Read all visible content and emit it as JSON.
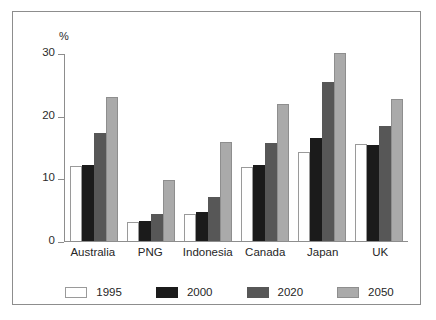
{
  "chart_data": {
    "type": "bar",
    "title": "",
    "subtitle": "",
    "xlabel": "",
    "ylabel": "%",
    "unit_label": "%",
    "ylim": [
      0,
      30
    ],
    "yticks": [
      0,
      10,
      20,
      30
    ],
    "ytick_labels": [
      "0",
      "10",
      "20",
      "30"
    ],
    "grid": false,
    "legend_position": "bottom",
    "categories": [
      "Australia",
      "PNG",
      "Indonesia",
      "Canada",
      "Japan",
      "UK"
    ],
    "series": [
      {
        "name": "1995",
        "color": "#ffffff",
        "values": [
          12.0,
          3.0,
          4.3,
          11.8,
          14.2,
          15.5
        ]
      },
      {
        "name": "2000",
        "color": "#1b1b1b",
        "values": [
          12.2,
          3.2,
          4.7,
          12.2,
          16.5,
          15.3
        ]
      },
      {
        "name": "2020",
        "color": "#575757",
        "values": [
          17.3,
          4.3,
          7.1,
          15.7,
          25.3,
          18.4
        ]
      },
      {
        "name": "2050",
        "color": "#aaaaaa",
        "values": [
          23.0,
          9.8,
          15.8,
          21.8,
          30.0,
          22.6
        ]
      }
    ]
  },
  "legend": {
    "items": [
      {
        "label": "1995",
        "swatch": "#ffffff"
      },
      {
        "label": "2000",
        "swatch": "#1b1b1b"
      },
      {
        "label": "2020",
        "swatch": "#575757"
      },
      {
        "label": "2050",
        "swatch": "#aaaaaa"
      }
    ]
  },
  "colors": {
    "frame": "#8d8d8d",
    "axis": "#8d8d8d",
    "text": "#262626",
    "background": "#ffffff"
  }
}
